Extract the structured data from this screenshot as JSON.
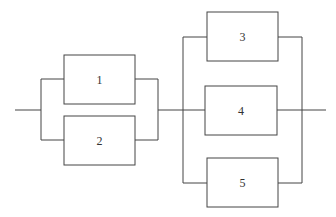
{
  "diagram": {
    "type": "reliability-block-diagram",
    "stages": [
      {
        "name": "stage-1-parallel",
        "blocks": [
          {
            "label": "1"
          },
          {
            "label": "2"
          }
        ]
      },
      {
        "name": "stage-2-parallel",
        "blocks": [
          {
            "label": "3"
          },
          {
            "label": "4"
          },
          {
            "label": "5"
          }
        ]
      }
    ],
    "colors": {
      "line": "#444444",
      "box_fill": "#ffffff"
    }
  }
}
